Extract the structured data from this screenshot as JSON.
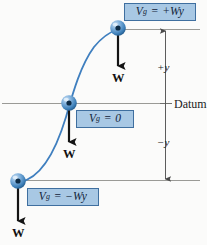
{
  "figure": {
    "name": "gravitational-potential-energy-datum-diagram",
    "background_color": "#fbfbfa",
    "curve_color": "#3f7fbf",
    "rule_color": "#9a9a96",
    "sphere_color": "#2f6fae",
    "box_fill": "#a8c8e4",
    "box_border": "#3f6f9f",
    "arrow_color": "#141414"
  },
  "labels": {
    "datum": "Datum",
    "plus_y": "+y",
    "minus_y": "−y",
    "weight": "W"
  },
  "callouts": [
    {
      "id": "top",
      "symbol": "V",
      "subscript": "g",
      "equals": "=",
      "value": "+Wy",
      "full_text": "Vg = +Wy",
      "state": "above-datum"
    },
    {
      "id": "middle",
      "symbol": "V",
      "subscript": "g",
      "equals": "=",
      "value": "0",
      "full_text": "Vg = 0",
      "state": "at-datum"
    },
    {
      "id": "bottom",
      "symbol": "V",
      "subscript": "g",
      "equals": "=",
      "value": "−Wy",
      "full_text": "Vg = −Wy",
      "state": "below-datum"
    }
  ],
  "weights": [
    {
      "id": "top",
      "label": "W"
    },
    {
      "id": "middle",
      "label": "W"
    },
    {
      "id": "bottom",
      "label": "W"
    }
  ],
  "dimensions": [
    {
      "id": "plus-y",
      "label": "+y",
      "from": "datum",
      "to": "upper-level"
    },
    {
      "id": "minus-y",
      "label": "−y",
      "from": "datum",
      "to": "lower-level"
    }
  ]
}
